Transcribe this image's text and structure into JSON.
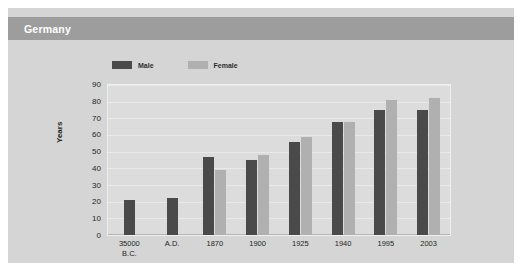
{
  "header": {
    "title": "Germany"
  },
  "legend": {
    "position": "top-center",
    "entries": [
      {
        "label": "Male",
        "color": "#4a4a4a"
      },
      {
        "label": "Female",
        "color": "#b0b0b0"
      }
    ]
  },
  "colors": {
    "header_bar": "#9d9d9d",
    "panel": "#d5d5d5",
    "plot_area": "#dcdcdc",
    "gridline": "#e9e9e9",
    "male": "#4a4a4a",
    "female": "#b0b0b0",
    "title_text": "#ffffff",
    "axis_text": "#1f1f1f"
  },
  "chart_data": {
    "type": "bar",
    "title": "Germany",
    "xlabel": "",
    "ylabel": "Years",
    "ylim": [
      0,
      90
    ],
    "yticks": [
      90,
      80,
      70,
      60,
      50,
      40,
      30,
      20,
      10,
      0
    ],
    "grid": true,
    "categories": [
      "35000\nB.C.",
      "A.D.",
      "1870",
      "1900",
      "1925",
      "1940",
      "1995",
      "2003"
    ],
    "series": [
      {
        "name": "Male",
        "color": "#4a4a4a",
        "values": [
          21,
          22,
          47,
          45,
          56,
          68,
          75,
          75
        ]
      },
      {
        "name": "Female",
        "color": "#b0b0b0",
        "values": [
          null,
          null,
          39,
          48,
          59,
          68,
          81,
          82
        ]
      }
    ]
  }
}
